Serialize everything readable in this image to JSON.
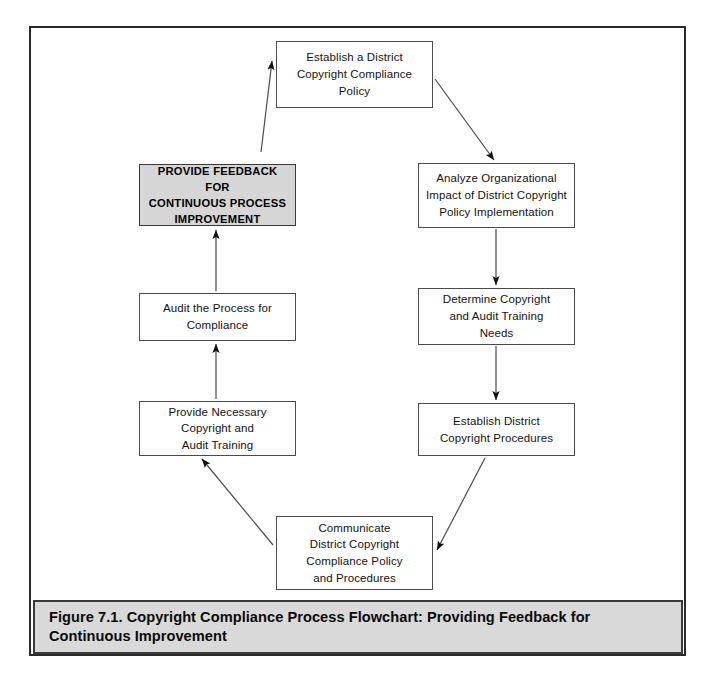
{
  "figure": {
    "caption": "Figure 7.1.  Copyright Compliance Process Flowchart: Providing Feedback for\nContinuous Improvement",
    "border_color": "#2b2b2b",
    "caption_background": "#d9d9d9",
    "emphasis_fill": "#d6d6d6"
  },
  "diagram": {
    "type": "flowchart",
    "orientation": "cycle",
    "nodes": [
      {
        "id": "establish-policy",
        "label": "Establish a District\nCopyright Compliance\nPolicy",
        "x": 276,
        "y": 41,
        "width": 157,
        "height": 67,
        "emphasis": false
      },
      {
        "id": "analyze-impact",
        "label": "Analyze Organizational\nImpact of District Copyright\nPolicy Implementation",
        "x": 418,
        "y": 163,
        "width": 157,
        "height": 65,
        "emphasis": false
      },
      {
        "id": "determine-training-needs",
        "label": "Determine Copyright\nand Audit Training\nNeeds",
        "x": 418,
        "y": 288,
        "width": 157,
        "height": 57,
        "emphasis": false
      },
      {
        "id": "establish-procedures",
        "label": "Establish District\nCopyright Procedures",
        "x": 418,
        "y": 403,
        "width": 157,
        "height": 53,
        "emphasis": false
      },
      {
        "id": "communicate-policy",
        "label": "Communicate\nDistrict Copyright\nCompliance Policy\nand Procedures",
        "x": 276,
        "y": 516,
        "width": 157,
        "height": 74,
        "emphasis": false
      },
      {
        "id": "provide-training",
        "label": "Provide Necessary\nCopyright and\nAudit Training",
        "x": 139,
        "y": 401,
        "width": 157,
        "height": 55,
        "emphasis": false
      },
      {
        "id": "audit-process",
        "label": "Audit the Process for\nCompliance",
        "x": 139,
        "y": 293,
        "width": 157,
        "height": 48,
        "emphasis": false
      },
      {
        "id": "provide-feedback",
        "label": "PROVIDE FEEDBACK FOR\nCONTINUOUS PROCESS\nIMPROVEMENT",
        "x": 139,
        "y": 164,
        "width": 157,
        "height": 62,
        "emphasis": true
      }
    ],
    "edges": [
      {
        "id": "feedback-to-establish",
        "from": "provide-feedback",
        "to": "establish-policy",
        "x1": 261,
        "y1": 152,
        "x2": 272,
        "y2": 61,
        "arrow": true
      },
      {
        "id": "establish-to-analyze",
        "from": "establish-policy",
        "to": "analyze-impact",
        "x1": 435,
        "y1": 79,
        "x2": 494,
        "y2": 160,
        "arrow": true
      },
      {
        "id": "analyze-to-determine",
        "from": "analyze-impact",
        "to": "determine-training-needs",
        "x1": 496,
        "y1": 229,
        "x2": 496,
        "y2": 285,
        "arrow": true
      },
      {
        "id": "determine-to-procedures",
        "from": "determine-training-needs",
        "to": "establish-procedures",
        "x1": 496,
        "y1": 346,
        "x2": 496,
        "y2": 400,
        "arrow": true
      },
      {
        "id": "procedures-to-communicate",
        "from": "establish-procedures",
        "to": "communicate-policy",
        "x1": 485,
        "y1": 458,
        "x2": 437,
        "y2": 550,
        "arrow": true
      },
      {
        "id": "communicate-to-training",
        "from": "communicate-policy",
        "to": "provide-training",
        "x1": 273,
        "y1": 545,
        "x2": 202,
        "y2": 459,
        "arrow": true
      },
      {
        "id": "training-to-audit",
        "from": "provide-training",
        "to": "audit-process",
        "x1": 216,
        "y1": 399,
        "x2": 216,
        "y2": 344,
        "arrow": true
      },
      {
        "id": "audit-to-feedback",
        "from": "audit-process",
        "to": "provide-feedback",
        "x1": 216,
        "y1": 291,
        "x2": 216,
        "y2": 230,
        "arrow": true
      }
    ],
    "line_color": "#4a4a4a",
    "arrow_color": "#111111"
  }
}
